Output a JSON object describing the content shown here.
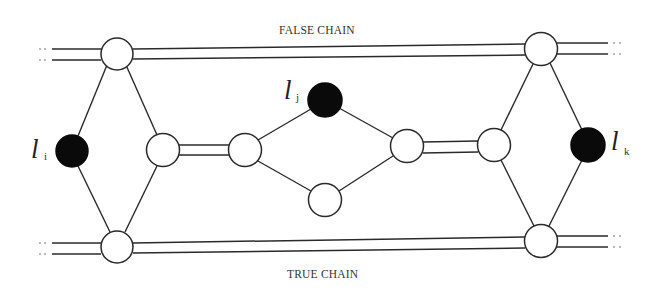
{
  "diagram": {
    "labels": {
      "false_chain": "FALSE CHAIN",
      "true_chain": "TRUE CHAIN"
    },
    "literals": [
      {
        "id": "li",
        "letter": "l",
        "subscript": "i"
      },
      {
        "id": "lj",
        "letter": "l",
        "subscript": "j"
      },
      {
        "id": "lk",
        "letter": "l",
        "subscript": "k"
      }
    ],
    "colors": {
      "stroke": "#2a2a2a",
      "filled_node": "#0a0a0a",
      "empty_node": "#ffffff",
      "background": "#ffffff"
    },
    "nodes": [
      {
        "id": "false-left",
        "fill": "white",
        "cx": 117,
        "cy": 52
      },
      {
        "id": "false-right",
        "fill": "white",
        "cx": 541,
        "cy": 49
      },
      {
        "id": "true-left",
        "fill": "white",
        "cx": 117,
        "cy": 247
      },
      {
        "id": "true-right",
        "fill": "white",
        "cx": 541,
        "cy": 241
      },
      {
        "id": "li",
        "fill": "black",
        "cx": 72,
        "cy": 151
      },
      {
        "id": "left-mid",
        "fill": "white",
        "cx": 163,
        "cy": 150
      },
      {
        "id": "gadget-left",
        "fill": "white",
        "cx": 245,
        "cy": 150
      },
      {
        "id": "lj",
        "fill": "black",
        "cx": 325,
        "cy": 100
      },
      {
        "id": "gadget-bottom",
        "fill": "white",
        "cx": 325,
        "cy": 200
      },
      {
        "id": "gadget-right",
        "fill": "white",
        "cx": 407,
        "cy": 146
      },
      {
        "id": "right-mid",
        "fill": "white",
        "cx": 494,
        "cy": 145
      },
      {
        "id": "lk",
        "fill": "black",
        "cx": 588,
        "cy": 145
      }
    ],
    "edges": [
      {
        "from": "false-left",
        "to": "li",
        "type": "single"
      },
      {
        "from": "false-left",
        "to": "left-mid",
        "type": "single"
      },
      {
        "from": "li",
        "to": "true-left",
        "type": "single"
      },
      {
        "from": "left-mid",
        "to": "true-left",
        "type": "single"
      },
      {
        "from": "left-mid",
        "to": "gadget-left",
        "type": "double"
      },
      {
        "from": "gadget-left",
        "to": "lj",
        "type": "single"
      },
      {
        "from": "gadget-left",
        "to": "gadget-bottom",
        "type": "single"
      },
      {
        "from": "lj",
        "to": "gadget-right",
        "type": "single"
      },
      {
        "from": "gadget-bottom",
        "to": "gadget-right",
        "type": "single"
      },
      {
        "from": "gadget-right",
        "to": "right-mid",
        "type": "double"
      },
      {
        "from": "false-right",
        "to": "right-mid",
        "type": "single"
      },
      {
        "from": "false-right",
        "to": "lk",
        "type": "single"
      },
      {
        "from": "right-mid",
        "to": "true-right",
        "type": "single"
      },
      {
        "from": "lk",
        "to": "true-right",
        "type": "single"
      },
      {
        "from": "false-left",
        "to": "false-right",
        "type": "double",
        "chain": "false"
      },
      {
        "from": "true-left",
        "to": "true-right",
        "type": "double",
        "chain": "true"
      }
    ],
    "continuation_marker": "::"
  }
}
